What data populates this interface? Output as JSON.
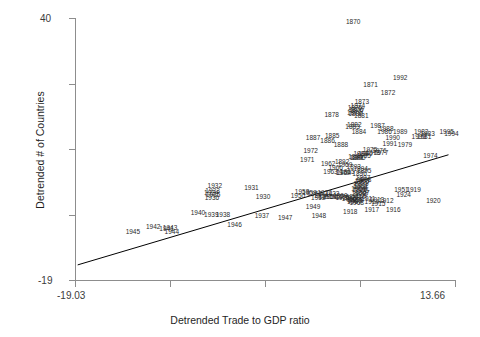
{
  "chart_data": {
    "type": "scatter",
    "title": "",
    "xlabel": "Detrended Trade to GDP ratio",
    "ylabel": "Detrended # of Countries",
    "xlim": [
      -19.03,
      13.66
    ],
    "ylim": [
      -19,
      40
    ],
    "xticklabels": [
      "-19.03",
      "13.66"
    ],
    "yticklabels": [
      "40",
      "-19"
    ],
    "grid": false,
    "legend": null,
    "point_label_field": "year",
    "marker": "text-label",
    "trendline": {
      "type": "linear-fit",
      "x": [
        -18.8,
        13.1
      ],
      "y": [
        -15.6,
        9.2
      ],
      "color": "#000000"
    },
    "points": [
      {
        "year": "1870",
        "x": 4.9,
        "y": 39.0
      },
      {
        "year": "1992",
        "x": 8.95,
        "y": 26.4
      },
      {
        "year": "1871",
        "x": 6.4,
        "y": 25.0
      },
      {
        "year": "1872",
        "x": 7.9,
        "y": 23.2
      },
      {
        "year": "1873",
        "x": 5.65,
        "y": 21.0
      },
      {
        "year": "1874",
        "x": 5.3,
        "y": 20.1
      },
      {
        "year": "1875",
        "x": 5.05,
        "y": 19.7
      },
      {
        "year": "1876",
        "x": 5.15,
        "y": 19.3
      },
      {
        "year": "1877",
        "x": 5.25,
        "y": 19.0
      },
      {
        "year": "1879",
        "x": 5.0,
        "y": 18.6
      },
      {
        "year": "1880",
        "x": 5.1,
        "y": 18.3
      },
      {
        "year": "1881",
        "x": 5.6,
        "y": 18.0
      },
      {
        "year": "1878",
        "x": 3.05,
        "y": 18.1
      },
      {
        "year": "1882",
        "x": 5.0,
        "y": 16.0
      },
      {
        "year": "1883",
        "x": 4.85,
        "y": 15.5
      },
      {
        "year": "1884",
        "x": 5.4,
        "y": 14.3
      },
      {
        "year": "1987",
        "x": 7.0,
        "y": 15.6
      },
      {
        "year": "1988",
        "x": 7.75,
        "y": 15.0
      },
      {
        "year": "1986",
        "x": 7.6,
        "y": 14.3
      },
      {
        "year": "1989",
        "x": 8.95,
        "y": 14.4
      },
      {
        "year": "1982",
        "x": 10.75,
        "y": 14.4
      },
      {
        "year": "1983",
        "x": 11.3,
        "y": 13.8
      },
      {
        "year": "1981",
        "x": 11.0,
        "y": 13.2
      },
      {
        "year": "1993",
        "x": 10.55,
        "y": 13.2
      },
      {
        "year": "1995",
        "x": 12.95,
        "y": 14.3
      },
      {
        "year": "1994",
        "x": 13.35,
        "y": 13.9
      },
      {
        "year": "1990",
        "x": 8.3,
        "y": 13.0
      },
      {
        "year": "1885",
        "x": 3.1,
        "y": 13.4
      },
      {
        "year": "1886",
        "x": 2.7,
        "y": 12.3
      },
      {
        "year": "1887",
        "x": 1.45,
        "y": 13.0
      },
      {
        "year": "1888",
        "x": 3.85,
        "y": 11.4
      },
      {
        "year": "1991",
        "x": 8.05,
        "y": 11.7
      },
      {
        "year": "1979",
        "x": 9.35,
        "y": 11.3
      },
      {
        "year": "1974",
        "x": 11.55,
        "y": 9.0
      },
      {
        "year": "1972",
        "x": 1.25,
        "y": 10.1
      },
      {
        "year": "1975",
        "x": 6.35,
        "y": 10.2
      },
      {
        "year": "1976",
        "x": 7.15,
        "y": 10.1
      },
      {
        "year": "1977",
        "x": 7.3,
        "y": 9.6
      },
      {
        "year": "1978",
        "x": 6.6,
        "y": 9.5
      },
      {
        "year": "1980",
        "x": 5.95,
        "y": 9.4
      },
      {
        "year": "1984",
        "x": 5.55,
        "y": 9.3
      },
      {
        "year": "1985",
        "x": 5.8,
        "y": 9.0
      },
      {
        "year": "1889",
        "x": 5.1,
        "y": 8.8
      },
      {
        "year": "1890",
        "x": 5.35,
        "y": 8.5
      },
      {
        "year": "1891",
        "x": 5.2,
        "y": 8.5
      },
      {
        "year": "1971",
        "x": 0.95,
        "y": 8.0
      },
      {
        "year": "1892",
        "x": 3.95,
        "y": 7.5
      },
      {
        "year": "1962",
        "x": 2.75,
        "y": 7.1
      },
      {
        "year": "1969",
        "x": 4.2,
        "y": 6.9
      },
      {
        "year": "1966",
        "x": 3.4,
        "y": 6.2
      },
      {
        "year": "1963",
        "x": 2.95,
        "y": 5.4
      },
      {
        "year": "1964",
        "x": 4.1,
        "y": 5.2
      },
      {
        "year": "1965",
        "x": 4.4,
        "y": 5.3
      },
      {
        "year": "1893",
        "x": 4.95,
        "y": 6.4
      },
      {
        "year": "1894",
        "x": 5.55,
        "y": 6.0
      },
      {
        "year": "1895",
        "x": 5.85,
        "y": 5.6
      },
      {
        "year": "1896",
        "x": 5.45,
        "y": 4.9
      },
      {
        "year": "1970",
        "x": 4.0,
        "y": 5.0
      },
      {
        "year": "1897",
        "x": 5.75,
        "y": 4.0
      },
      {
        "year": "1898",
        "x": 5.85,
        "y": 3.6
      },
      {
        "year": "1899",
        "x": 5.7,
        "y": 3.3
      },
      {
        "year": "1900",
        "x": 5.65,
        "y": 3.0
      },
      {
        "year": "1932",
        "x": -7.0,
        "y": 2.1
      },
      {
        "year": "1933",
        "x": -7.2,
        "y": 1.0
      },
      {
        "year": "1934",
        "x": -7.3,
        "y": 0.5
      },
      {
        "year": "1935",
        "x": -7.15,
        "y": 0.1
      },
      {
        "year": "1936",
        "x": -7.25,
        "y": -0.5
      },
      {
        "year": "1931",
        "x": -3.85,
        "y": 1.7
      },
      {
        "year": "1958",
        "x": 0.5,
        "y": 0.9
      },
      {
        "year": "1959",
        "x": 1.15,
        "y": 0.7
      },
      {
        "year": "1950",
        "x": 0.15,
        "y": -0.1
      },
      {
        "year": "1951",
        "x": 9.05,
        "y": 1.2
      },
      {
        "year": "1919",
        "x": 10.1,
        "y": 1.3
      },
      {
        "year": "1924",
        "x": 9.25,
        "y": 0.2
      },
      {
        "year": "1920",
        "x": 11.8,
        "y": -1.3
      },
      {
        "year": "1901",
        "x": 5.55,
        "y": 2.6
      },
      {
        "year": "1902",
        "x": 5.6,
        "y": 2.2
      },
      {
        "year": "1903",
        "x": 5.5,
        "y": 1.9
      },
      {
        "year": "1904",
        "x": 5.35,
        "y": 1.6
      },
      {
        "year": "1905",
        "x": 5.45,
        "y": 1.3
      },
      {
        "year": "1906",
        "x": 5.6,
        "y": 1.0
      },
      {
        "year": "1907",
        "x": 5.7,
        "y": 0.7
      },
      {
        "year": "1908",
        "x": 5.4,
        "y": 0.3
      },
      {
        "year": "1909",
        "x": 5.5,
        "y": 0.0
      },
      {
        "year": "1910",
        "x": 5.35,
        "y": -0.3
      },
      {
        "year": "1911",
        "x": 6.2,
        "y": -0.8
      },
      {
        "year": "1913",
        "x": 6.95,
        "y": -1.0
      },
      {
        "year": "1914",
        "x": 6.5,
        "y": -1.5
      },
      {
        "year": "1915",
        "x": 7.05,
        "y": -1.9
      },
      {
        "year": "1912",
        "x": 7.75,
        "y": -1.2
      },
      {
        "year": "1953",
        "x": 1.6,
        "y": 0.3
      },
      {
        "year": "1954",
        "x": 2.15,
        "y": 0.0
      },
      {
        "year": "1955",
        "x": 2.55,
        "y": -0.2
      },
      {
        "year": "1956",
        "x": 2.95,
        "y": -0.4
      },
      {
        "year": "1957",
        "x": 3.45,
        "y": -0.3
      },
      {
        "year": "1952",
        "x": 1.9,
        "y": -0.6
      },
      {
        "year": "1960",
        "x": 3.8,
        "y": -0.1
      },
      {
        "year": "1961",
        "x": 4.25,
        "y": -0.3
      },
      {
        "year": "1921",
        "x": 4.75,
        "y": -0.6
      },
      {
        "year": "1922",
        "x": 2.45,
        "y": 0.5
      },
      {
        "year": "1923",
        "x": 3.1,
        "y": 0.3
      },
      {
        "year": "1925",
        "x": 4.0,
        "y": -0.5
      },
      {
        "year": "1926",
        "x": 4.55,
        "y": -0.8
      },
      {
        "year": "1927",
        "x": 4.95,
        "y": -0.9
      },
      {
        "year": "1928",
        "x": 5.15,
        "y": -1.0
      },
      {
        "year": "1929",
        "x": 5.05,
        "y": -1.2
      },
      {
        "year": "1930",
        "x": -2.85,
        "y": -0.4
      },
      {
        "year": "1967",
        "x": 5.0,
        "y": -1.4
      },
      {
        "year": "1968",
        "x": 5.2,
        "y": -1.6
      },
      {
        "year": "1916",
        "x": 8.35,
        "y": -3.3
      },
      {
        "year": "1917",
        "x": 6.5,
        "y": -3.3
      },
      {
        "year": "1918",
        "x": 4.65,
        "y": -3.6
      },
      {
        "year": "1949",
        "x": 1.45,
        "y": -2.5
      },
      {
        "year": "1948",
        "x": 1.95,
        "y": -4.7
      },
      {
        "year": "1947",
        "x": -0.95,
        "y": -5.0
      },
      {
        "year": "1937",
        "x": -2.95,
        "y": -4.7
      },
      {
        "year": "1938",
        "x": -6.3,
        "y": -4.4
      },
      {
        "year": "1939",
        "x": -7.3,
        "y": -4.4
      },
      {
        "year": "1940",
        "x": -8.45,
        "y": -4.0
      },
      {
        "year": "1946",
        "x": -5.3,
        "y": -6.6
      },
      {
        "year": "1942",
        "x": -12.3,
        "y": -7.1
      },
      {
        "year": "1943",
        "x": -10.85,
        "y": -7.3
      },
      {
        "year": "1941",
        "x": -11.15,
        "y": -7.6
      },
      {
        "year": "1944",
        "x": -10.7,
        "y": -8.1
      },
      {
        "year": "1945",
        "x": -14.05,
        "y": -8.3
      }
    ]
  }
}
